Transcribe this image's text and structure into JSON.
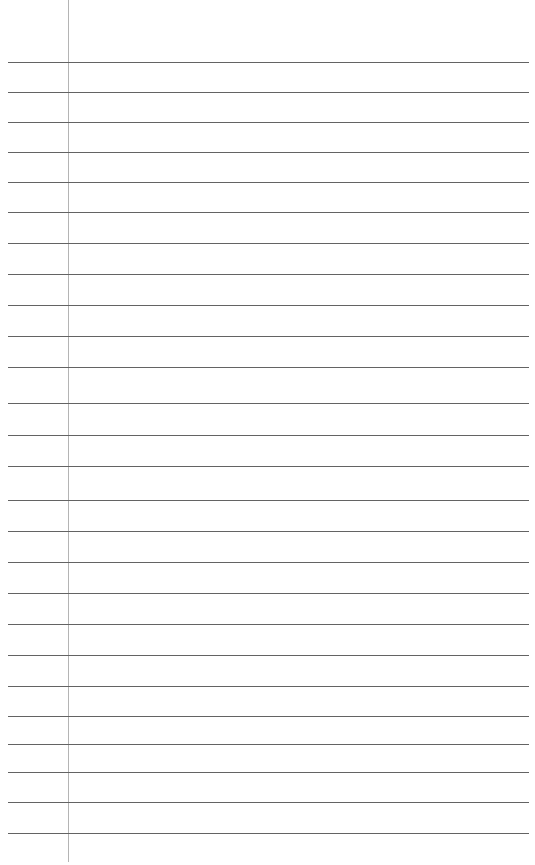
{
  "page": {
    "kind": "lined-notebook-paper",
    "title": "",
    "width": 535,
    "height": 865,
    "background_color": "#ffffff",
    "text_content": "",
    "note": "blank ruled page, no writing present"
  },
  "margin_rule": {
    "name": "vertical-margin-line",
    "color": "#b4b4b4",
    "x": 68,
    "y_start": 0,
    "y_end": 862,
    "thickness": 1
  },
  "ruled_lines": {
    "name": "horizontal-ruled-lines",
    "color": "#636363",
    "thickness": 1,
    "x_start": 8,
    "x_end": 529,
    "count": 26,
    "first_y": 62,
    "spacing": 30.8,
    "positions": [
      62,
      92,
      122,
      152,
      182,
      212,
      243,
      274,
      305,
      336,
      367,
      403,
      435,
      466,
      500,
      531,
      562,
      593,
      624,
      655,
      686,
      716,
      744,
      772,
      802,
      833
    ]
  }
}
